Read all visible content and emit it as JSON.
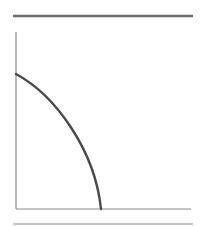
{
  "diagram": {
    "type": "concave-curve-on-axes",
    "colors": {
      "background": "#ffffff",
      "rule": "#6e6e6e",
      "axis": "#8a8a8a",
      "curve": "#4a4a4a"
    },
    "top_rule": {
      "x1": 13,
      "y1": 16,
      "x2": 193,
      "y2": 16
    },
    "bottom_rule": {
      "x1": 13,
      "y1": 224,
      "x2": 193,
      "y2": 224
    },
    "y_axis": {
      "x1": 16,
      "y1": 32,
      "x2": 16,
      "y2": 209
    },
    "x_axis": {
      "x1": 16,
      "y1": 209,
      "x2": 191,
      "y2": 209
    },
    "curve": {
      "start": [
        16,
        74
      ],
      "end": [
        101,
        209
      ],
      "path": "M16,74 C55,95 95,150 101,209"
    }
  }
}
